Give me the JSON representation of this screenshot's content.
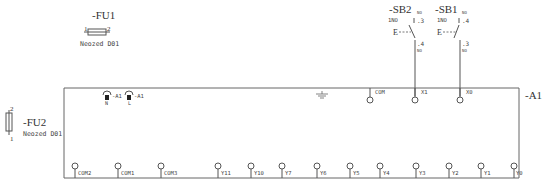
{
  "diagram": {
    "type": "electrical-schematic",
    "line_color": "#555555",
    "text_color": "#333333"
  },
  "fuses": [
    {
      "id": "FU1",
      "label": "-FU1",
      "part": "Neozed D01",
      "pin_left": "1",
      "pin_right": "2",
      "orientation": "horizontal"
    },
    {
      "id": "FU2",
      "label": "-FU2",
      "part": "Neozed D01",
      "pin_top": "2",
      "pin_bottom": "1",
      "orientation": "vertical"
    }
  ],
  "switches": [
    {
      "id": "SB2",
      "label": "-SB2",
      "type": "1NO",
      "marker": "E",
      "pin_top": ".3",
      "pin_bottom": ".4",
      "small_top": "NO",
      "small_bottom": "NO"
    },
    {
      "id": "SB1",
      "label": "-SB1",
      "type": "1NO",
      "marker": "E",
      "pin_top": ".4",
      "pin_bottom": ".3",
      "small_top": "NO",
      "small_bottom": "NO"
    }
  ],
  "module": {
    "label": "-A1",
    "power_terminals": [
      {
        "name": "N",
        "ref": "-A1"
      },
      {
        "name": "L",
        "ref": "-A1"
      }
    ],
    "top_terminals": [
      "COM",
      "X1",
      "X0"
    ],
    "bottom_terminals": [
      "COM2",
      "COM1",
      "COM3",
      "Y11",
      "Y10",
      "Y7",
      "Y6",
      "Y5",
      "Y4",
      "Y3",
      "Y2",
      "Y1",
      "Y0"
    ]
  }
}
